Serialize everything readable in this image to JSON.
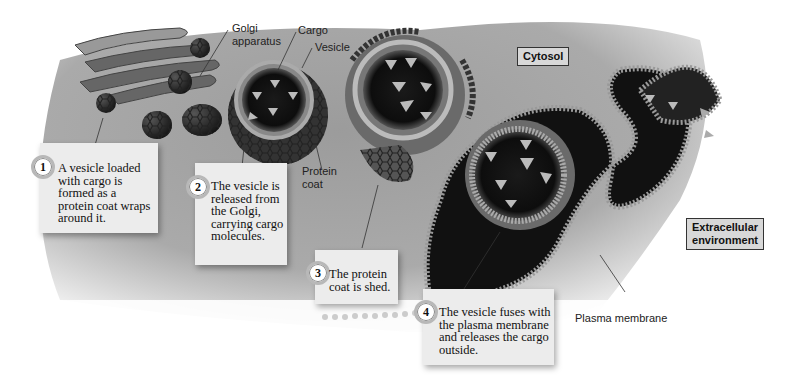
{
  "diagram": {
    "labels": {
      "golgi": "Golgi\napparatus",
      "golgi_line1": "Golgi",
      "golgi_line2": "apparatus",
      "cargo": "Cargo",
      "vesicle": "Vesicle",
      "protein_coat_line1": "Protein",
      "protein_coat_line2": "coat",
      "plasma_membrane": "Plasma membrane"
    },
    "regions": {
      "cytosol": "Cytosol",
      "extracellular_line1": "Extracellular",
      "extracellular_line2": "environment"
    },
    "steps": [
      {
        "number": "1",
        "text": "A vesicle loaded with cargo is formed as a protein coat wraps around it."
      },
      {
        "number": "2",
        "text": "The vesicle is released from the Golgi, carrying cargo molecules."
      },
      {
        "number": "3",
        "text": "The protein coat is shed."
      },
      {
        "number": "4",
        "text": "The vesicle fuses with the plasma membrane and releases the cargo outside."
      }
    ]
  }
}
